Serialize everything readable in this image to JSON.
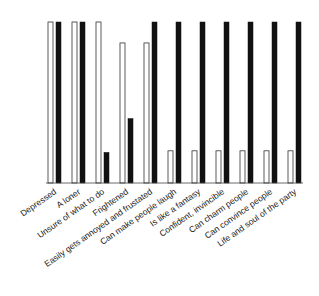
{
  "chart_data": {
    "type": "bar",
    "title": "",
    "xlabel": "",
    "ylabel": "",
    "ylim": [
      0,
      100
    ],
    "grid": false,
    "legend": null,
    "categories": [
      "Depressed",
      "A loner",
      "Unsure of what to do",
      "Frightened",
      "Easily gets annoyed and frustated",
      "Can make people laugh",
      "Is like a fantasy",
      "Confident, invincible",
      "Can charm people",
      "Can convince people",
      "Life and soul of the party"
    ],
    "series": [
      {
        "name": "white",
        "color": "#ffffff",
        "values": [
          100,
          100,
          100,
          87,
          87,
          20,
          20,
          20,
          20,
          20,
          20
        ]
      },
      {
        "name": "black",
        "color": "#111111",
        "values": [
          100,
          100,
          19,
          40,
          100,
          100,
          100,
          100,
          100,
          100,
          100
        ]
      }
    ]
  }
}
